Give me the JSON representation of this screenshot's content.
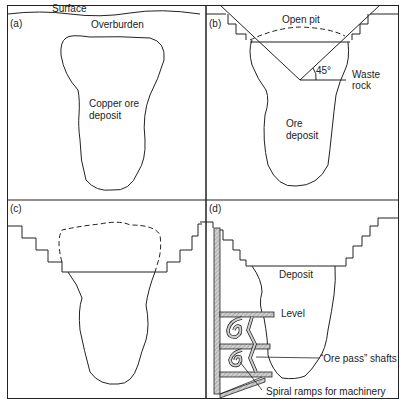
{
  "figure": {
    "panels": [
      {
        "id": "a",
        "label": "(a)",
        "texts": {
          "surface": "Surface",
          "overburden": "Overburden",
          "deposit_line1": "Copper ore",
          "deposit_line2": "deposit"
        }
      },
      {
        "id": "b",
        "label": "(b)",
        "texts": {
          "open_pit": "Open pit",
          "angle": "45°",
          "waste_line1": "Waste",
          "waste_line2": "rock",
          "deposit_line1": "Ore",
          "deposit_line2": "deposit"
        }
      },
      {
        "id": "c",
        "label": "(c)",
        "texts": {}
      },
      {
        "id": "d",
        "label": "(d)",
        "texts": {
          "deposit": "Deposit",
          "level": "Level",
          "ore_pass": "“Ore pass” shafts",
          "spiral": "Spiral ramps for machinery"
        }
      }
    ],
    "colors": {
      "line": "#222222",
      "hatch": "#bbbbbb",
      "background": "#ffffff"
    }
  }
}
